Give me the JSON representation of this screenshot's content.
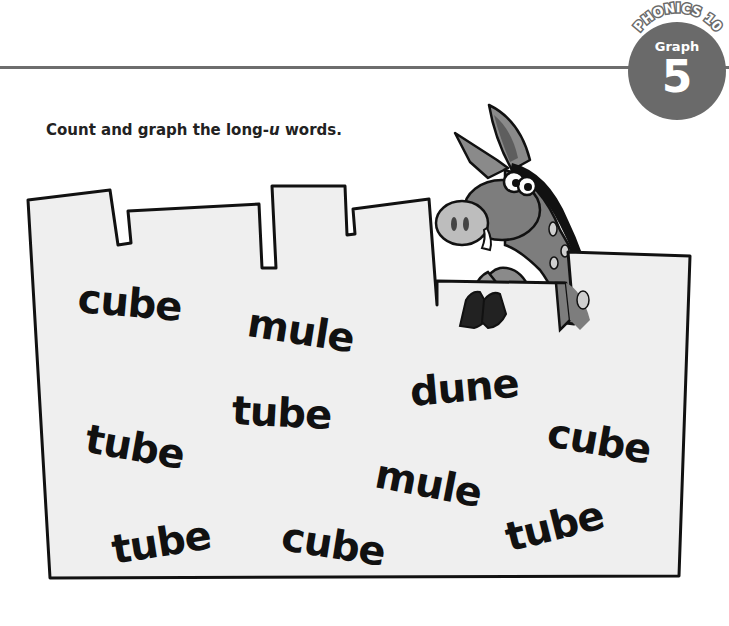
{
  "header": {
    "series": "PHONICS 10",
    "section": "Graph",
    "number": "5"
  },
  "instruction": {
    "prefix": "Count and graph the long-",
    "letter": "u",
    "suffix": " words."
  },
  "illustration": {
    "character": "donkey-peeking-over-wall",
    "wall_fill": "#efefef",
    "outline": "#111111"
  },
  "words": [
    {
      "text": "cube",
      "x": 78,
      "y": 278,
      "rot": 5
    },
    {
      "text": "mule",
      "x": 248,
      "y": 302,
      "rot": 9
    },
    {
      "text": "dune",
      "x": 410,
      "y": 372,
      "rot": -5
    },
    {
      "text": "tube",
      "x": 86,
      "y": 418,
      "rot": 10
    },
    {
      "text": "tube",
      "x": 232,
      "y": 390,
      "rot": 3
    },
    {
      "text": "cube",
      "x": 548,
      "y": 412,
      "rot": 10
    },
    {
      "text": "mule",
      "x": 376,
      "y": 453,
      "rot": 11
    },
    {
      "text": "tube",
      "x": 112,
      "y": 530,
      "rot": -9
    },
    {
      "text": "cube",
      "x": 282,
      "y": 516,
      "rot": 9
    },
    {
      "text": "tube",
      "x": 506,
      "y": 518,
      "rot": -14
    }
  ],
  "colors": {
    "badge": "#6a6a6a",
    "rule": "#6d6d6d",
    "text": "#222222"
  }
}
